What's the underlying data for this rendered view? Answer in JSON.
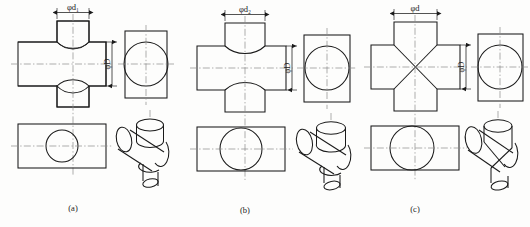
{
  "figure": {
    "type": "engineering-drawing",
    "background_color": "#fdfdfc",
    "line_color": "#1a1a1a",
    "centerline_color": "#8a8a8a",
    "panels": [
      {
        "id": "a",
        "caption": "(a)",
        "dim_small_label": "φd₁",
        "dim_large_label": "φD",
        "case": "small-bore",
        "intersection_shape": "concave-arc-toward-small-cylinder",
        "diameter_ratio": 0.42
      },
      {
        "id": "b",
        "caption": "(b)",
        "dim_small_label": "φd₂",
        "dim_large_label": "φD",
        "case": "medium-bore",
        "intersection_shape": "concave-arc-toward-small-cylinder",
        "diameter_ratio": 0.66
      },
      {
        "id": "c",
        "caption": "(c)",
        "dim_small_label": "φd",
        "dim_large_label": "φD",
        "case": "equal-diameter",
        "intersection_shape": "straight-diagonal-lines-forming-x",
        "diameter_ratio": 1.0
      }
    ],
    "views": {
      "front": "front-view",
      "side": "side-view",
      "top": "top-view",
      "pictorial": "isometric-pictorial-view"
    }
  }
}
